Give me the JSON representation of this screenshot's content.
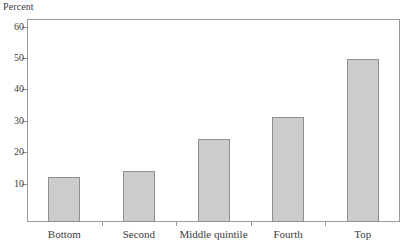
{
  "chart_data": {
    "type": "bar",
    "title": "",
    "subtitle": "",
    "xlabel": "",
    "ylabel": "Percent",
    "categories": [
      "Bottom",
      "Second",
      "Middle quintile",
      "Fourth",
      "Top"
    ],
    "values": [
      12.3,
      14.2,
      24.2,
      31.4,
      49.6
    ],
    "yticks": [
      10,
      20,
      30,
      40,
      50,
      60
    ],
    "ytick_labels": [
      "10",
      "20",
      "30",
      "40",
      "50",
      "60"
    ],
    "ylim": [
      -2.1,
      62.4
    ],
    "grid": false,
    "legend": false,
    "legend_position": "none",
    "bar_fill_color": "#cccccc",
    "bar_border_color": "#8f8f8f",
    "axis_color": "#9a9a9a",
    "text_color": "#3b3b3b",
    "background_color": "#ffffff",
    "annotations": []
  },
  "axis": {
    "y_caption": "Percent"
  }
}
